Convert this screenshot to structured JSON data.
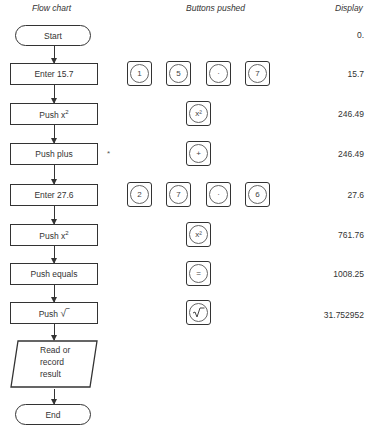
{
  "headers": {
    "flow_chart": "Flow chart",
    "buttons_pushed": "Buttons pushed",
    "display": "Display"
  },
  "flow": {
    "start": "Start",
    "steps": [
      {
        "label": "Enter 15.7",
        "display": "15.7"
      },
      {
        "label": "Push x",
        "sup": "2",
        "display": "246.49"
      },
      {
        "label": "Push plus",
        "display": "246.49",
        "note": "*"
      },
      {
        "label": "Enter 27.6",
        "display": "27.6"
      },
      {
        "label": "Push x",
        "sup": "2",
        "display": "761.76"
      },
      {
        "label": "Push equals",
        "display": "1008.25"
      },
      {
        "label": "Push",
        "symbol": "√‾",
        "display": "31.752952"
      }
    ],
    "output": {
      "line1": "Read or",
      "line2": "record",
      "line3": "result"
    },
    "end": "End",
    "initial_display": "0."
  },
  "buttons": {
    "row1": [
      "1",
      "5",
      "·",
      "7"
    ],
    "row2": [
      "x²"
    ],
    "row3": [
      "+"
    ],
    "row4": [
      "2",
      "7",
      "·",
      "6"
    ],
    "row5": [
      "x²"
    ],
    "row6": [
      "="
    ],
    "row7": [
      "√"
    ]
  }
}
